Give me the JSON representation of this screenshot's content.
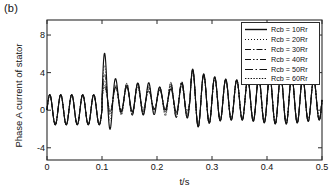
{
  "panel": {
    "label": "(b)"
  },
  "chart_data": {
    "type": "line",
    "title": "",
    "subtitle": "",
    "xlabel": "t/s",
    "ylabel": "Phase A current of stator",
    "xlim": [
      0,
      0.5
    ],
    "ylim": [
      -5.3,
      9.6
    ],
    "xticks": [
      0,
      0.1,
      0.2,
      0.3,
      0.4,
      0.5
    ],
    "xtick_labels": [
      "0",
      "0.1",
      "0.2",
      "0.3",
      "0.4",
      "0.5"
    ],
    "yticks": [
      -4,
      0,
      4,
      8
    ],
    "ytick_labels": [
      "-4",
      "0",
      "4",
      "8"
    ],
    "grid": false,
    "legend_position": "upper right",
    "annotations": [],
    "series": [
      {
        "name": "Rcb = 10Rr",
        "label": "Rcb = 10Rr",
        "dash": "none",
        "color": "#111111",
        "envelope": {
          "segments": [
            {
              "t_start": 0.0,
              "t_end": 0.1,
              "amp_start": 1.6,
              "amp_end": 1.6,
              "offset": 0.05
            },
            {
              "t_start": 0.1,
              "t_end": 0.18,
              "amp_start": 4.3,
              "amp_end": 1.35,
              "offset": 1.25
            },
            {
              "t_start": 0.18,
              "t_end": 0.26,
              "amp_start": 1.35,
              "amp_end": 1.55,
              "offset": 1.15
            },
            {
              "t_start": 0.26,
              "t_end": 0.32,
              "amp_start": 3.1,
              "amp_end": 2.4,
              "offset": 1.15
            },
            {
              "t_start": 0.32,
              "t_end": 0.5,
              "amp_start": 2.4,
              "amp_end": 2.35,
              "offset": 1.1
            }
          ]
        }
      },
      {
        "name": "Rcb = 20Rr",
        "label": "Rcb = 20Rr",
        "dash": "dotted",
        "color": "#111111",
        "envelope": {
          "segments": [
            {
              "t_start": 0.0,
              "t_end": 0.1,
              "amp_start": 1.6,
              "amp_end": 1.6,
              "offset": 0.05
            },
            {
              "t_start": 0.1,
              "t_end": 0.18,
              "amp_start": 3.4,
              "amp_end": 1.3,
              "offset": 1.22
            },
            {
              "t_start": 0.18,
              "t_end": 0.26,
              "amp_start": 1.3,
              "amp_end": 1.52,
              "offset": 1.14
            },
            {
              "t_start": 0.26,
              "t_end": 0.32,
              "amp_start": 3.05,
              "amp_end": 2.38,
              "offset": 1.14
            },
            {
              "t_start": 0.32,
              "t_end": 0.5,
              "amp_start": 2.38,
              "amp_end": 2.33,
              "offset": 1.1
            }
          ]
        }
      },
      {
        "name": "Rcb = 30Rr",
        "label": "Rcb = 30Rr",
        "dash": "dash-dot",
        "color": "#111111",
        "envelope": {
          "segments": [
            {
              "t_start": 0.0,
              "t_end": 0.1,
              "amp_start": 1.6,
              "amp_end": 1.6,
              "offset": 0.05
            },
            {
              "t_start": 0.1,
              "t_end": 0.18,
              "amp_start": 2.85,
              "amp_end": 1.28,
              "offset": 1.2
            },
            {
              "t_start": 0.18,
              "t_end": 0.26,
              "amp_start": 1.28,
              "amp_end": 1.5,
              "offset": 1.13
            },
            {
              "t_start": 0.26,
              "t_end": 0.32,
              "amp_start": 3.02,
              "amp_end": 2.36,
              "offset": 1.13
            },
            {
              "t_start": 0.32,
              "t_end": 0.5,
              "amp_start": 2.36,
              "amp_end": 2.32,
              "offset": 1.1
            }
          ]
        }
      },
      {
        "name": "Rcb = 40Rr",
        "label": "Rcb = 40Rr",
        "dash": "dash-dot-dot",
        "color": "#111111",
        "envelope": {
          "segments": [
            {
              "t_start": 0.0,
              "t_end": 0.1,
              "amp_start": 1.6,
              "amp_end": 1.6,
              "offset": 0.05
            },
            {
              "t_start": 0.1,
              "t_end": 0.18,
              "amp_start": 2.45,
              "amp_end": 1.26,
              "offset": 1.18
            },
            {
              "t_start": 0.18,
              "t_end": 0.26,
              "amp_start": 1.26,
              "amp_end": 1.49,
              "offset": 1.12
            },
            {
              "t_start": 0.26,
              "t_end": 0.32,
              "amp_start": 3.0,
              "amp_end": 2.35,
              "offset": 1.12
            },
            {
              "t_start": 0.32,
              "t_end": 0.5,
              "amp_start": 2.35,
              "amp_end": 2.31,
              "offset": 1.1
            }
          ]
        }
      },
      {
        "name": "Rcb = 50Rr",
        "label": "Rcb = 50Rr",
        "dash": "long-dash-dot",
        "color": "#111111",
        "envelope": {
          "segments": [
            {
              "t_start": 0.0,
              "t_end": 0.1,
              "amp_start": 1.6,
              "amp_end": 1.6,
              "offset": 0.05
            },
            {
              "t_start": 0.1,
              "t_end": 0.18,
              "amp_start": 2.15,
              "amp_end": 1.24,
              "offset": 1.16
            },
            {
              "t_start": 0.18,
              "t_end": 0.26,
              "amp_start": 1.24,
              "amp_end": 1.48,
              "offset": 1.11
            },
            {
              "t_start": 0.26,
              "t_end": 0.32,
              "amp_start": 2.98,
              "amp_end": 2.34,
              "offset": 1.11
            },
            {
              "t_start": 0.32,
              "t_end": 0.5,
              "amp_start": 2.34,
              "amp_end": 2.3,
              "offset": 1.1
            }
          ]
        }
      },
      {
        "name": "Rcb = 60Rr",
        "label": "Rcb = 60Rr",
        "dash": "fine-dotted",
        "color": "#111111",
        "envelope": {
          "segments": [
            {
              "t_start": 0.0,
              "t_end": 0.1,
              "amp_start": 1.6,
              "amp_end": 1.6,
              "offset": 0.05
            },
            {
              "t_start": 0.1,
              "t_end": 0.18,
              "amp_start": 1.95,
              "amp_end": 1.22,
              "offset": 1.15
            },
            {
              "t_start": 0.18,
              "t_end": 0.26,
              "amp_start": 1.22,
              "amp_end": 1.47,
              "offset": 1.1
            },
            {
              "t_start": 0.26,
              "t_end": 0.32,
              "amp_start": 2.96,
              "amp_end": 2.33,
              "offset": 1.1
            },
            {
              "t_start": 0.32,
              "t_end": 0.5,
              "amp_start": 2.33,
              "amp_end": 2.29,
              "offset": 1.1
            }
          ]
        }
      }
    ],
    "carrier_frequency_hz": 50,
    "modulation": {
      "enabled": true,
      "freq_hz": 12.5,
      "depth_after_fault": 0.3,
      "t_start": 0.1,
      "t_end": 0.26
    }
  }
}
